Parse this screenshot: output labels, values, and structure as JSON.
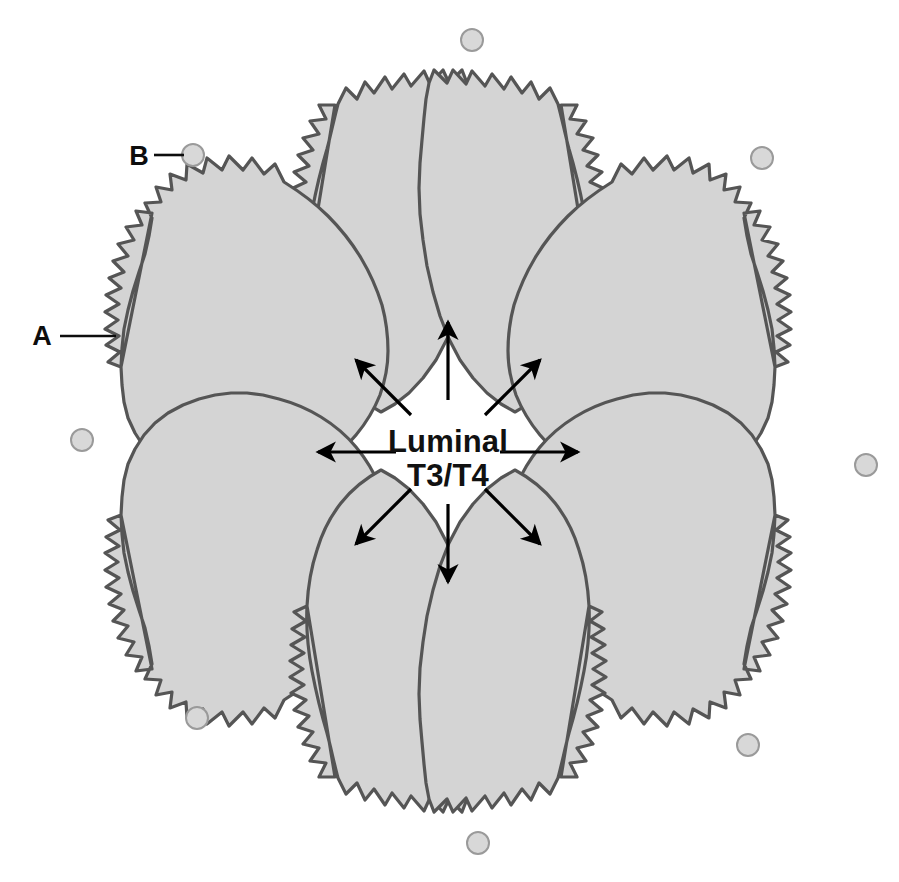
{
  "figure": {
    "background_color": "#ffffff",
    "width": 899,
    "height": 882
  },
  "lumen": {
    "label_line1": "Luminal",
    "label_line2": "T3/T4",
    "center_x": 448,
    "center_y": 452,
    "text_color": "#111111"
  },
  "markers": [
    {
      "id": "A",
      "label": "A",
      "description": "follicular cell apical microvillous border",
      "label_x": 42,
      "label_y": 345,
      "leader_from_x": 60,
      "leader_from_y": 336,
      "leader_to_x": 116,
      "leader_to_y": 336
    },
    {
      "id": "B",
      "label": "B",
      "description": "capillary",
      "label_x": 139,
      "label_y": 165,
      "leader_from_x": 154,
      "leader_from_y": 155,
      "leader_to_x": 184,
      "leader_to_y": 155
    }
  ],
  "cells": {
    "count": 8,
    "name": "follicular-cell",
    "fill_color": "#d4d4d4",
    "stroke_color": "#555555",
    "stroke_width": 3.2,
    "outer_edge": "sawtooth-microvilli",
    "inner_edge": "smooth-wavy",
    "angles_deg": [
      250,
      290,
      335,
      25,
      70,
      110,
      155,
      205
    ]
  },
  "capillaries": {
    "count": 8,
    "name": "capillary",
    "fill_color": "#d8d8d8",
    "stroke_color": "#9a9a9a",
    "radius": 11,
    "positions": [
      {
        "x": 472,
        "y": 40
      },
      {
        "x": 762,
        "y": 158
      },
      {
        "x": 866,
        "y": 465
      },
      {
        "x": 748,
        "y": 745
      },
      {
        "x": 478,
        "y": 843
      },
      {
        "x": 197,
        "y": 718
      },
      {
        "x": 82,
        "y": 440
      },
      {
        "x": 193,
        "y": 155
      }
    ]
  },
  "arrows": {
    "count": 8,
    "name": "secretion-arrow",
    "color": "#000000",
    "shaft_width": 3.2,
    "directions_deg": [
      270,
      315,
      0,
      45,
      90,
      135,
      180,
      225
    ],
    "inner_radius": 52,
    "outer_radius": 152
  }
}
